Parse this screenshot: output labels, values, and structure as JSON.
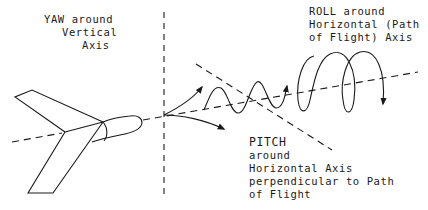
{
  "diagram": {
    "colors": {
      "stroke": "#1a1a1a",
      "background": "#ffffff"
    },
    "labels": {
      "yaw": {
        "lines": [
          "YAW around",
          "Vertical",
          "Axis"
        ]
      },
      "roll": {
        "lines": [
          "ROLL around",
          "Horizontal (Path",
          "of Flight) Axis"
        ]
      },
      "pitch": {
        "lines": [
          "PITCH",
          "around",
          "Horizontal Axis",
          "perpendicular to Path",
          "of Flight"
        ]
      }
    },
    "elements": [
      "aircraft-tail-section",
      "vertical-axis-dashed-line",
      "horizontal-flight-path-axis-dashed-line",
      "pitch-axis-dashed-line",
      "yaw-arrows",
      "pitch-wave-arrow",
      "roll-spiral-arrow"
    ]
  }
}
